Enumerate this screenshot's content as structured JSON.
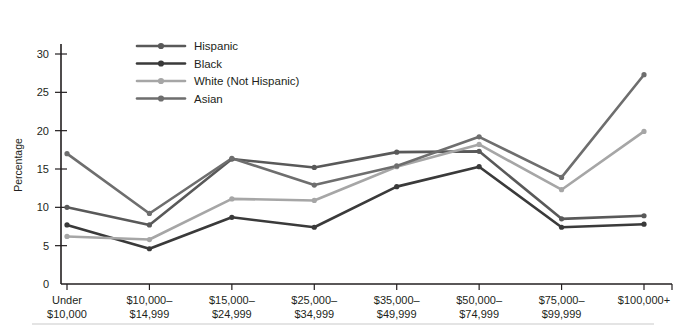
{
  "chart_data": {
    "type": "line",
    "title": "",
    "xlabel": "",
    "ylabel": "Percentage",
    "ylim": [
      0,
      30
    ],
    "yticks": [
      0,
      5,
      10,
      15,
      20,
      25,
      30
    ],
    "grid": false,
    "legend_position": "top-left-inside",
    "categories": [
      "Under\n$10,000",
      "$10,000–\n$14,999",
      "$15,000–\n$24,999",
      "$25,000–\n$34,999",
      "$35,000–\n$49,999",
      "$50,000–\n$74,999",
      "$75,000–\n$99,999",
      "$100,000+"
    ],
    "category_lines": [
      [
        "Under",
        "$10,000"
      ],
      [
        "$10,000–",
        "$14,999"
      ],
      [
        "$15,000–",
        "$24,999"
      ],
      [
        "$25,000–",
        "$34,999"
      ],
      [
        "$35,000–",
        "$49,999"
      ],
      [
        "$50,000–",
        "$74,999"
      ],
      [
        "$75,000–",
        "$99,999"
      ],
      [
        "$100,000+",
        ""
      ]
    ],
    "series": [
      {
        "name": "Hispanic",
        "color": "#595959",
        "values": [
          10.0,
          7.7,
          16.3,
          15.2,
          17.2,
          17.3,
          8.5,
          8.9
        ]
      },
      {
        "name": "Black",
        "color": "#3a3a3a",
        "values": [
          7.7,
          4.6,
          8.7,
          7.4,
          12.7,
          15.3,
          7.4,
          7.8
        ]
      },
      {
        "name": "White (Not Hispanic)",
        "color": "#a6a6a6",
        "values": [
          6.2,
          5.8,
          11.1,
          10.9,
          15.3,
          18.2,
          12.3,
          19.9
        ]
      },
      {
        "name": "Asian",
        "color": "#6e6e6e",
        "values": [
          17.0,
          9.2,
          16.4,
          12.9,
          15.4,
          19.2,
          13.9,
          27.3
        ]
      }
    ]
  },
  "legend": {
    "items": [
      {
        "label": "Hispanic"
      },
      {
        "label": "Black"
      },
      {
        "label": "White (Not Hispanic)"
      },
      {
        "label": "Asian"
      }
    ]
  },
  "axes": {
    "y_title": "Percentage",
    "y_tick_labels": [
      "30",
      "25",
      "20",
      "15",
      "10",
      "5",
      "0"
    ]
  }
}
